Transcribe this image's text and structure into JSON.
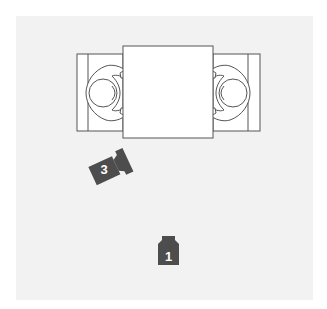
{
  "diagram": {
    "type": "floor-plan",
    "background_color": "#f2f2f2",
    "line_color": "#555555",
    "table": {
      "label": ""
    },
    "seats": [
      {
        "id": "left-seat",
        "side": "left"
      },
      {
        "id": "right-seat",
        "side": "right"
      }
    ],
    "cameras": [
      {
        "number": "3",
        "position": "lower-left of table",
        "color": "#4d4d4d"
      },
      {
        "number": "1",
        "position": "bottom center",
        "color": "#4d4d4d"
      }
    ]
  }
}
